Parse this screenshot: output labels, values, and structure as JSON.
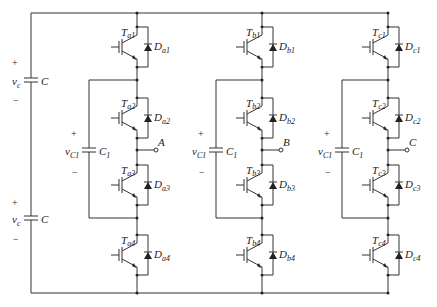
{
  "diagram": {
    "title": "",
    "type": "three-phase four-switch-per-leg flying capacitor converter",
    "dc_link": {
      "capacitors": [
        {
          "name": "C",
          "voltage_label": "v",
          "voltage_sub": "c",
          "plus": "+",
          "minus": "−"
        },
        {
          "name": "C",
          "voltage_label": "v",
          "voltage_sub": "c",
          "plus": "+",
          "minus": "−"
        }
      ]
    },
    "legs": [
      {
        "phase": "a",
        "output": "A",
        "flying_cap": {
          "name": "C",
          "name_sub": "1",
          "voltage_label": "v",
          "voltage_sub": "C1",
          "plus": "+",
          "minus": "−"
        },
        "switches": [
          {
            "t": "T",
            "t_sub": "a1",
            "d": "D",
            "d_sub": "a1"
          },
          {
            "t": "T",
            "t_sub": "a2",
            "d": "D",
            "d_sub": "a2"
          },
          {
            "t": "T",
            "t_sub": "a3",
            "d": "D",
            "d_sub": "a3"
          },
          {
            "t": "T",
            "t_sub": "a4",
            "d": "D",
            "d_sub": "a4"
          }
        ]
      },
      {
        "phase": "b",
        "output": "B",
        "flying_cap": {
          "name": "C",
          "name_sub": "1",
          "voltage_label": "v",
          "voltage_sub": "C1",
          "plus": "+",
          "minus": "−"
        },
        "switches": [
          {
            "t": "T",
            "t_sub": "b1",
            "d": "D",
            "d_sub": "b1"
          },
          {
            "t": "T",
            "t_sub": "b2",
            "d": "D",
            "d_sub": "b2"
          },
          {
            "t": "T",
            "t_sub": "b3",
            "d": "D",
            "d_sub": "b3"
          },
          {
            "t": "T",
            "t_sub": "b4",
            "d": "D",
            "d_sub": "b4"
          }
        ]
      },
      {
        "phase": "c",
        "output": "C",
        "flying_cap": {
          "name": "C",
          "name_sub": "1",
          "voltage_label": "v",
          "voltage_sub": "C1",
          "plus": "+",
          "minus": "−"
        },
        "switches": [
          {
            "t": "T",
            "t_sub": "c1",
            "d": "D",
            "d_sub": "c1"
          },
          {
            "t": "T",
            "t_sub": "c2",
            "d": "D",
            "d_sub": "c2"
          },
          {
            "t": "T",
            "t_sub": "c3",
            "d": "D",
            "d_sub": "c3"
          },
          {
            "t": "T",
            "t_sub": "c4",
            "d": "D",
            "d_sub": "c4"
          }
        ]
      }
    ]
  }
}
